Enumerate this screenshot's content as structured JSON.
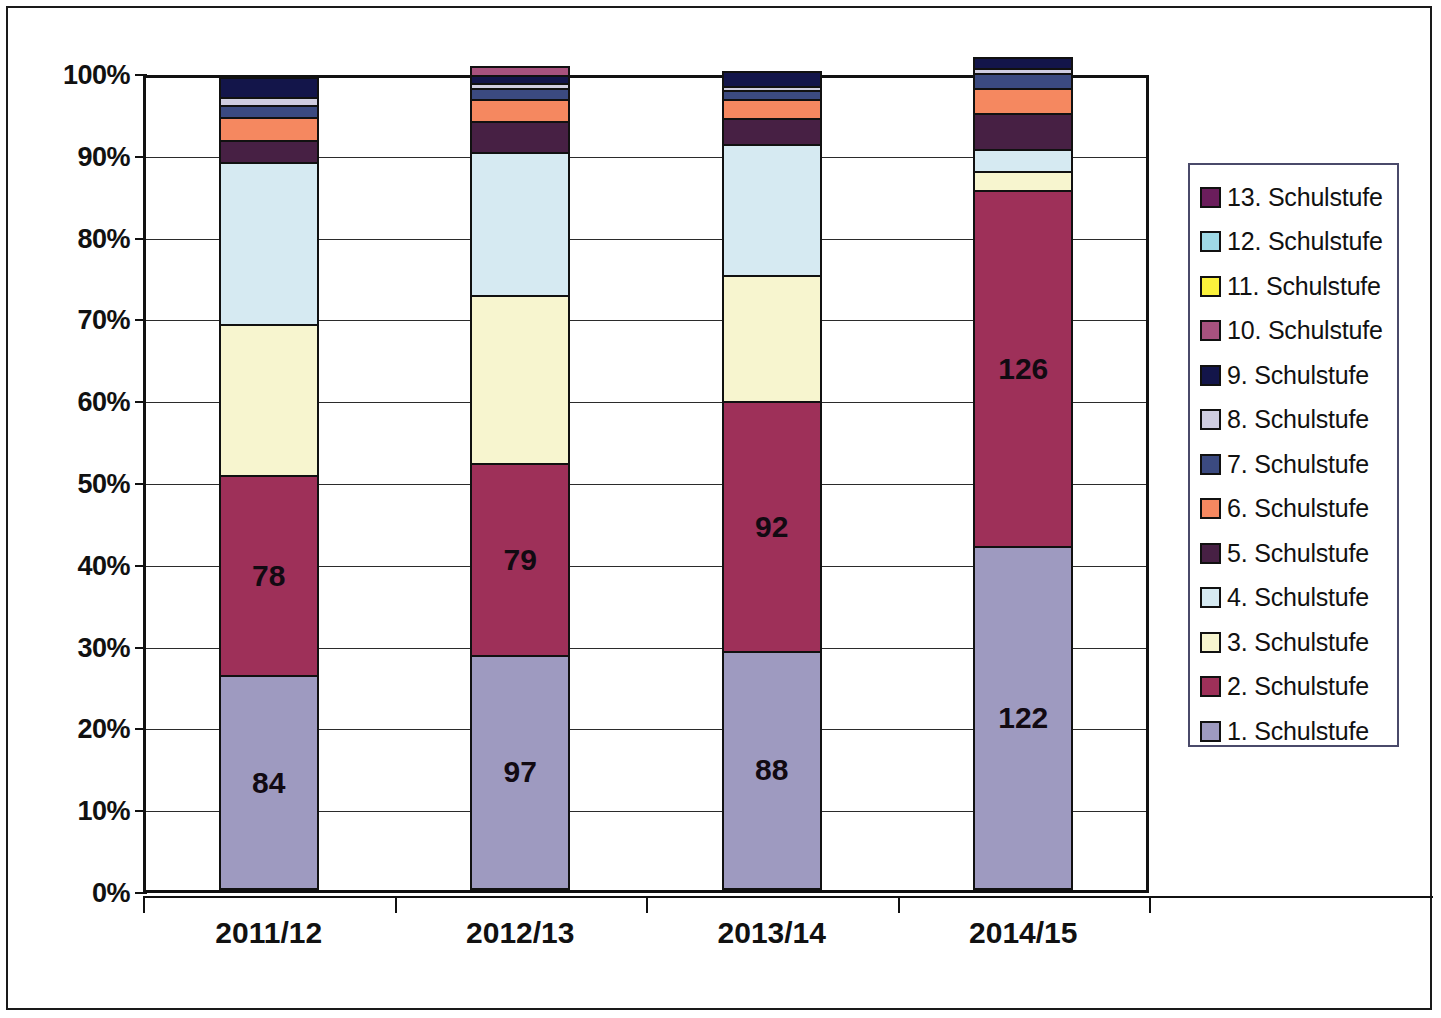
{
  "chart_data": {
    "type": "bar",
    "subtype": "stacked-100-percent",
    "title": "",
    "xlabel": "",
    "ylabel": "",
    "categories": [
      "2011/12",
      "2012/13",
      "2013/14",
      "2014/15"
    ],
    "ylim": [
      0,
      100
    ],
    "ytick_labels": [
      "0%",
      "10%",
      "20%",
      "30%",
      "40%",
      "50%",
      "60%",
      "70%",
      "80%",
      "90%",
      "100%"
    ],
    "ytick_values": [
      0,
      10,
      20,
      30,
      40,
      50,
      60,
      70,
      80,
      90,
      100
    ],
    "grid": true,
    "legend_position": "right",
    "legend_order_top_to_bottom": [
      "13. Schulstufe",
      "12. Schulstufe",
      "11. Schulstufe",
      "10. Schulstufe",
      "9. Schulstufe",
      "8. Schulstufe",
      "7. Schulstufe",
      "6. Schulstufe",
      "5. Schulstufe",
      "4. Schulstufe",
      "3. Schulstufe",
      "2. Schulstufe",
      "1. Schulstufe"
    ],
    "series": [
      {
        "name": "1. Schulstufe",
        "color": "#9e9ac0",
        "values_percent": [
          26.0,
          28.5,
          29.0,
          41.8
        ],
        "data_labels": [
          "84",
          "97",
          "88",
          "122"
        ]
      },
      {
        "name": "2. Schulstufe",
        "color": "#9e3059",
        "values_percent": [
          24.5,
          23.5,
          30.5,
          43.5
        ],
        "data_labels": [
          "78",
          "79",
          "92",
          "126"
        ]
      },
      {
        "name": "3. Schulstufe",
        "color": "#f7f5cf",
        "values_percent": [
          18.5,
          20.5,
          15.5,
          2.4
        ],
        "data_labels": [
          "",
          "",
          "",
          ""
        ]
      },
      {
        "name": "4. Schulstufe",
        "color": "#d6eaf2",
        "values_percent": [
          19.8,
          17.5,
          16.0,
          2.6
        ],
        "data_labels": [
          "",
          "",
          "",
          ""
        ]
      },
      {
        "name": "5. Schulstufe",
        "color": "#472044",
        "values_percent": [
          2.7,
          3.8,
          3.1,
          4.5
        ],
        "data_labels": [
          "",
          "",
          "",
          ""
        ]
      },
      {
        "name": "6. Schulstufe",
        "color": "#f58860",
        "values_percent": [
          2.8,
          2.6,
          2.3,
          3.0
        ],
        "data_labels": [
          "",
          "",
          "",
          ""
        ]
      },
      {
        "name": "7. Schulstufe",
        "color": "#3b4a80",
        "values_percent": [
          1.4,
          1.4,
          1.1,
          1.8
        ],
        "data_labels": [
          "",
          "",
          "",
          ""
        ]
      },
      {
        "name": "8. Schulstufe",
        "color": "#cfcde0",
        "values_percent": [
          1.0,
          0.6,
          0.6,
          0.7
        ],
        "data_labels": [
          "",
          "",
          "",
          ""
        ]
      },
      {
        "name": "9. Schulstufe",
        "color": "#13154a",
        "values_percent": [
          2.4,
          1.0,
          1.8,
          1.3
        ],
        "data_labels": [
          "",
          "",
          "",
          ""
        ]
      },
      {
        "name": "10. Schulstufe",
        "color": "#a8527e",
        "values_percent": [
          0.0,
          1.1,
          0.0,
          0.0
        ],
        "data_labels": [
          "",
          "",
          "",
          ""
        ]
      },
      {
        "name": "11. Schulstufe",
        "color": "#fbf23c",
        "values_percent": [
          0.0,
          0.0,
          0.0,
          0.0
        ],
        "data_labels": [
          "",
          "",
          "",
          ""
        ]
      },
      {
        "name": "12. Schulstufe",
        "color": "#9fd9e6",
        "values_percent": [
          0.0,
          0.0,
          0.0,
          0.0
        ],
        "data_labels": [
          "",
          "",
          "",
          ""
        ]
      },
      {
        "name": "13. Schulstufe",
        "color": "#6b1d5c",
        "values_percent": [
          0.0,
          0.0,
          0.0,
          0.0
        ],
        "data_labels": [
          "",
          "",
          "",
          ""
        ]
      }
    ]
  },
  "legend": {
    "items": [
      {
        "label": "13. Schulstufe",
        "color": "#6b1d5c"
      },
      {
        "label": "12. Schulstufe",
        "color": "#9fd9e6"
      },
      {
        "label": "11. Schulstufe",
        "color": "#fbf23c"
      },
      {
        "label": "10. Schulstufe",
        "color": "#a8527e"
      },
      {
        "label": "9. Schulstufe",
        "color": "#13154a"
      },
      {
        "label": "8. Schulstufe",
        "color": "#cfcde0"
      },
      {
        "label": "7. Schulstufe",
        "color": "#3b4a80"
      },
      {
        "label": "6. Schulstufe",
        "color": "#f58860"
      },
      {
        "label": "5. Schulstufe",
        "color": "#472044"
      },
      {
        "label": "4. Schulstufe",
        "color": "#d6eaf2"
      },
      {
        "label": "3. Schulstufe",
        "color": "#f7f5cf"
      },
      {
        "label": "2. Schulstufe",
        "color": "#9e3059"
      },
      {
        "label": "1. Schulstufe",
        "color": "#9e9ac0"
      }
    ]
  }
}
